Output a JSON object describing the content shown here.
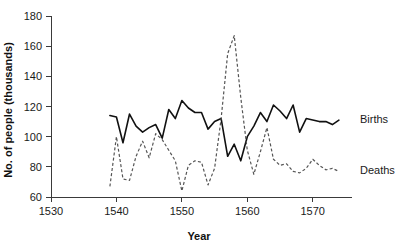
{
  "chart_data": {
    "type": "line",
    "title": "",
    "xlabel": "Year",
    "ylabel": "No. of people (thousands)",
    "xlim": [
      1530,
      1576
    ],
    "ylim": [
      60,
      180
    ],
    "xticks": [
      1530,
      1540,
      1550,
      1560,
      1570
    ],
    "yticks": [
      60,
      80,
      100,
      120,
      140,
      160,
      180
    ],
    "grid": false,
    "legend_position": "right-inline",
    "x": [
      1539,
      1540,
      1541,
      1542,
      1543,
      1544,
      1545,
      1546,
      1547,
      1548,
      1549,
      1550,
      1551,
      1552,
      1553,
      1554,
      1555,
      1556,
      1557,
      1558,
      1559,
      1560,
      1561,
      1562,
      1563,
      1564,
      1565,
      1566,
      1567,
      1568,
      1569,
      1570,
      1571,
      1572,
      1573,
      1574
    ],
    "series": [
      {
        "name": "Births",
        "style": "solid",
        "color": "#111111",
        "values": [
          114,
          113,
          96,
          115,
          107,
          103,
          106,
          108,
          99,
          118,
          112,
          124,
          119,
          116,
          116,
          105,
          110,
          112,
          87,
          95,
          84,
          100,
          107,
          116,
          110,
          121,
          117,
          112,
          121,
          103,
          112,
          111,
          110,
          110,
          108,
          111
        ]
      },
      {
        "name": "Deaths",
        "style": "dashed",
        "color": "#555555",
        "values": [
          67,
          100,
          72,
          71,
          87,
          97,
          86,
          102,
          98,
          91,
          84,
          64,
          81,
          84,
          83,
          68,
          79,
          112,
          155,
          167,
          126,
          91,
          75,
          90,
          106,
          85,
          81,
          82,
          77,
          76,
          79,
          85,
          81,
          78,
          79,
          77
        ]
      }
    ],
    "series_labels": [
      {
        "name": "Births",
        "y_value": 111
      },
      {
        "name": "Deaths",
        "y_value": 77
      }
    ]
  },
  "colors": {
    "births": "#111111",
    "deaths": "#555555",
    "axis": "#3a3a3a",
    "background": "#ffffff"
  }
}
